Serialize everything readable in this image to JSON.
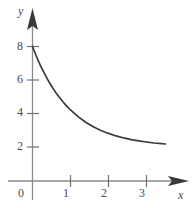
{
  "chart_data": {
    "type": "line",
    "title": "",
    "subtitle": "",
    "xlabel": "x",
    "ylabel": "y",
    "grid": false,
    "legend": false,
    "xlim": [
      -0.45,
      3.9
    ],
    "ylim": [
      -0.7,
      9.4
    ],
    "xticks": [
      0,
      1,
      2,
      3
    ],
    "yticks": [
      2,
      4,
      6,
      8
    ],
    "xtick_labels": [
      "0",
      "1",
      "2",
      "3"
    ],
    "ytick_labels": [
      "2",
      "4",
      "6",
      "8"
    ],
    "x_axis_arrow": true,
    "y_axis_arrow": true,
    "annotations": [],
    "series": [
      {
        "name": "decay curve",
        "equation": "y = 2 + 6e^(-x)",
        "x": [
          0,
          0.1,
          0.2,
          0.3,
          0.4,
          0.5,
          0.6,
          0.7,
          0.8,
          0.9,
          1.0,
          1.2,
          1.4,
          1.6,
          1.8,
          2.0,
          2.2,
          2.4,
          2.6,
          2.8,
          3.0,
          3.2,
          3.4,
          3.5
        ],
        "values": [
          8.0,
          7.43,
          6.91,
          6.45,
          6.02,
          5.64,
          5.29,
          4.98,
          4.7,
          4.44,
          4.21,
          3.81,
          3.48,
          3.21,
          2.99,
          2.81,
          2.66,
          2.54,
          2.44,
          2.37,
          2.3,
          2.24,
          2.2,
          2.18
        ]
      }
    ],
    "asymptote_y": 2,
    "y_intercept": 8
  },
  "labels": {
    "y_8": "8",
    "y_6": "6",
    "y_4": "4",
    "y_2": "2",
    "x_0": "0",
    "x_1": "1",
    "x_2": "2",
    "x_3": "3",
    "axis_x": "x",
    "axis_y": "y"
  },
  "colors": {
    "background": "#ffffff",
    "axis": "#8a8a8a",
    "curve": "#3a3a3a",
    "text": "#4a4a4a"
  }
}
